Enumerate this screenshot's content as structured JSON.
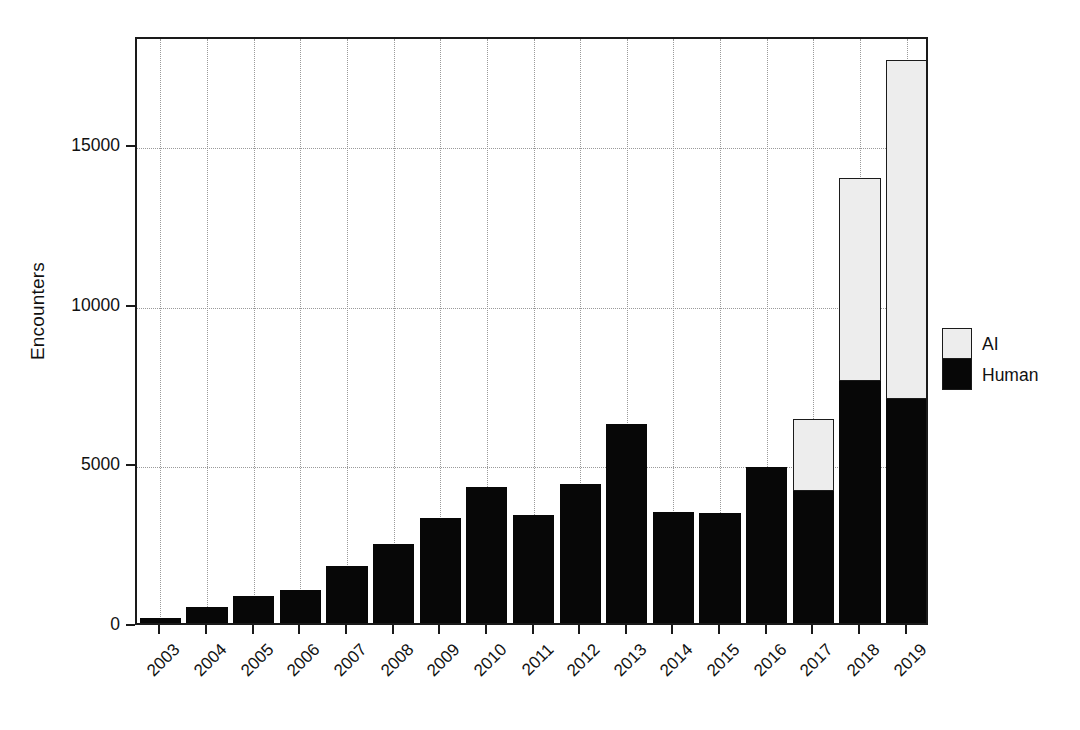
{
  "chart_data": {
    "type": "bar",
    "stacked": true,
    "title": "",
    "xlabel": "",
    "ylabel": "Encounters",
    "categories": [
      "2003",
      "2004",
      "2005",
      "2006",
      "2007",
      "2008",
      "2009",
      "2010",
      "2011",
      "2012",
      "2013",
      "2014",
      "2015",
      "2016",
      "2017",
      "2018",
      "2019"
    ],
    "series": [
      {
        "name": "Human",
        "color": "#070707",
        "values": [
          150,
          500,
          850,
          1020,
          1780,
          2460,
          3290,
          4250,
          3380,
          4340,
          6230,
          3480,
          3440,
          4870,
          4140,
          7590,
          7000
        ]
      },
      {
        "name": "AI",
        "color": "#ededed",
        "values": [
          0,
          0,
          0,
          0,
          0,
          0,
          0,
          0,
          0,
          0,
          0,
          0,
          0,
          0,
          2250,
          6330,
          10620
        ]
      }
    ],
    "totals": [
      150,
      500,
      850,
      1020,
      1780,
      2460,
      3290,
      4250,
      3380,
      4340,
      6230,
      3480,
      3440,
      4870,
      6390,
      13920,
      17620
    ],
    "ylim": [
      0,
      18410
    ],
    "yticks": [
      0,
      5000,
      10000,
      15000
    ],
    "ytick_labels": [
      "0",
      "5000",
      "10000",
      "15000"
    ],
    "grid": true,
    "grid_axes": "both",
    "legend_position": "right",
    "legend_entries": [
      {
        "label": "AI",
        "color": "#ededed"
      },
      {
        "label": "Human",
        "color": "#070707"
      }
    ]
  },
  "axis": {
    "y_title": "Encounters"
  },
  "colors": {
    "human": "#070707",
    "ai": "#ededed",
    "axis": "#1a1a1a",
    "grid": "#9a9a9a",
    "background": "#ffffff"
  }
}
